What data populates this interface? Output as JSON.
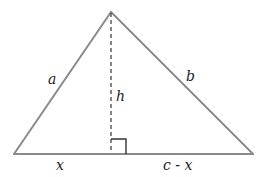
{
  "diagram": {
    "type": "triangle-with-altitude",
    "colors": {
      "background": "#ffffff",
      "sides": "#8a8a8a",
      "altitude": "#333333",
      "right_angle": "#333333",
      "labels": "#222222"
    },
    "vertices": {
      "apex": [
        111,
        12
      ],
      "bottom_left": [
        14,
        154
      ],
      "bottom_right": [
        253,
        154
      ],
      "foot": [
        111,
        154
      ]
    },
    "labels": {
      "left_side": "a",
      "right_side": "b",
      "altitude": "h",
      "base_left": "x",
      "base_right": "c - x"
    }
  }
}
